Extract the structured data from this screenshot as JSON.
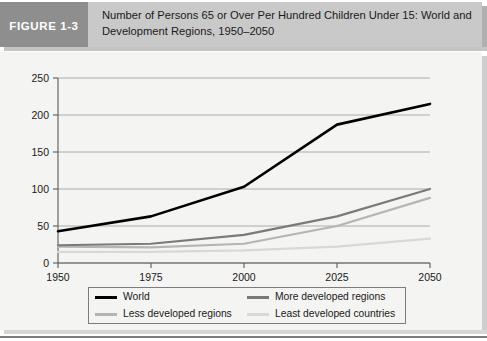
{
  "figure": {
    "number_label": "FIGURE 1-3",
    "title_line1": "Number of Persons 65 or Over Per Hundred Children Under 15: World and",
    "title_line2": "Development Regions, 1950–2050",
    "header_bg": "#c9c9c9",
    "number_bg": "#8e8e8e",
    "panel_bg": "#f4f4f2"
  },
  "chart_data": {
    "type": "line",
    "title": "Number of Persons 65 or Over Per Hundred Children Under 15: World and Development Regions, 1950–2050",
    "xlabel": "",
    "ylabel": "",
    "x": [
      1950,
      1975,
      2000,
      2025,
      2050
    ],
    "categories": [
      "1950",
      "1975",
      "2000",
      "2025",
      "2050"
    ],
    "xlim": [
      1950,
      2050
    ],
    "ylim": [
      0,
      250
    ],
    "yticks": [
      0,
      50,
      100,
      150,
      200,
      250
    ],
    "ytick_labels": [
      "0",
      "50",
      "100",
      "150",
      "200",
      "250"
    ],
    "xticks": [
      1950,
      1975,
      2000,
      2025,
      2050
    ],
    "xtick_labels": [
      "1950",
      "1975",
      "2000",
      "2025",
      "2050"
    ],
    "grid": "horizontal",
    "legend_position": "bottom",
    "series": [
      {
        "name": "World",
        "color": "#000000",
        "width": 2.6,
        "values": [
          43,
          63,
          103,
          187,
          215
        ]
      },
      {
        "name": "More developed regions",
        "color": "#7a7a7a",
        "width": 2.2,
        "values": [
          24,
          26,
          38,
          63,
          100
        ]
      },
      {
        "name": "Less developed regions",
        "color": "#b5b5b5",
        "width": 2.2,
        "values": [
          22,
          21,
          26,
          50,
          88
        ]
      },
      {
        "name": "Least developed countries",
        "color": "#d8d8d8",
        "width": 2.2,
        "values": [
          15,
          15,
          17,
          22,
          33
        ]
      }
    ]
  },
  "legend": {
    "items": [
      {
        "label": "World",
        "color": "#000000",
        "width": 3
      },
      {
        "label": "More developed regions",
        "color": "#7a7a7a",
        "width": 3
      },
      {
        "label": "Less developed regions",
        "color": "#b5b5b5",
        "width": 3
      },
      {
        "label": "Least developed countries",
        "color": "#d8d8d8",
        "width": 3
      }
    ]
  }
}
